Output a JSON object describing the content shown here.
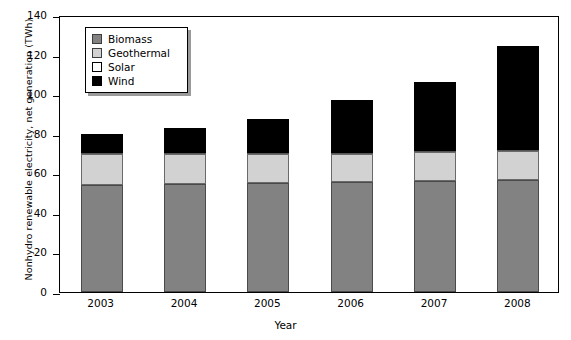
{
  "chart_data": {
    "type": "bar",
    "stacked": true,
    "title": "",
    "xlabel": "Year",
    "ylabel": "Nonhydro renewable electricity, net generation (TWh)",
    "categories": [
      "2003",
      "2004",
      "2005",
      "2006",
      "2007",
      "2008"
    ],
    "ylim": [
      0,
      140
    ],
    "yticks": [
      0,
      20,
      40,
      60,
      80,
      100,
      120,
      140
    ],
    "grid": false,
    "legend_position": "top-left",
    "series": [
      {
        "name": "Biomass",
        "color": "#828282",
        "values": [
          54.0,
          54.5,
          55.0,
          55.5,
          56.0,
          56.5
        ]
      },
      {
        "name": "Geothermal",
        "color": "#d2d2d2",
        "values": [
          16.0,
          15.5,
          15.0,
          14.5,
          15.0,
          15.0
        ]
      },
      {
        "name": "Solar",
        "color": "#ffffff",
        "values": [
          0.5,
          0.5,
          0.5,
          0.5,
          0.5,
          0.5
        ]
      },
      {
        "name": "Wind",
        "color": "#000000",
        "values": [
          9.5,
          12.5,
          17.0,
          26.5,
          34.5,
          52.5
        ]
      }
    ],
    "totals": [
      80.0,
      83.0,
      87.5,
      97.0,
      106.0,
      124.5
    ]
  },
  "legend": {
    "items": [
      {
        "label": "Biomass"
      },
      {
        "label": "Geothermal"
      },
      {
        "label": "Solar"
      },
      {
        "label": "Wind"
      }
    ]
  }
}
